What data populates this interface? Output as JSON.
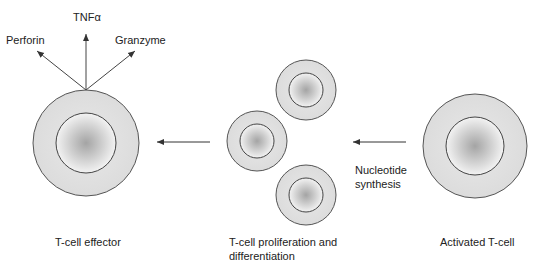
{
  "diagram": {
    "stages": [
      {
        "id": "effector",
        "label": "T-cell effector"
      },
      {
        "id": "proliferation",
        "label_line1": "T-cell proliferation and",
        "label_line2": "differentiation"
      },
      {
        "id": "activated",
        "label": "Activated T-cell"
      }
    ],
    "process_label_line1": "Nucleotide",
    "process_label_line2": "synthesis",
    "secreted": [
      {
        "label": "Perforin"
      },
      {
        "label": "TNFα"
      },
      {
        "label": "Granzyme"
      }
    ],
    "colors": {
      "cytoplasm": "#e2e2e2",
      "nucleus_center": "#a8a8a8",
      "nucleus_edge": "#f2f2f2",
      "outline": "#555555",
      "arrow": "#333333"
    }
  }
}
